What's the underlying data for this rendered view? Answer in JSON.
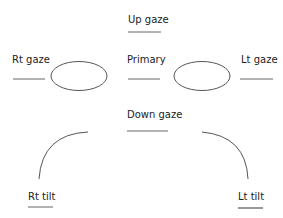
{
  "diagram": {
    "labels": {
      "up_gaze": "Up gaze",
      "rt_gaze": "Rt gaze",
      "primary": "Primary",
      "lt_gaze": "Lt gaze",
      "down_gaze": "Down gaze",
      "rt_tilt": "Rt tilt",
      "lt_tilt": "Lt tilt"
    },
    "colors": {
      "stroke": "#555555",
      "text": "#222222"
    }
  }
}
